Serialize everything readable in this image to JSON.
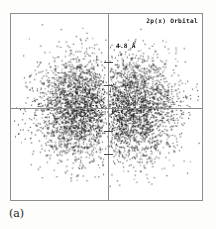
{
  "figure": {
    "caption": "(a)",
    "orbital_label": "2p(x) Orbital",
    "scale_label": "4.8 Å",
    "frame_color": "#8e8e8e",
    "axis_color": "#8a8a8a",
    "dot_color": "#111111",
    "background_color": "#ffffff"
  },
  "chart_data": {
    "type": "scatter",
    "title": "2p(x) Orbital",
    "subtitle": "(a)",
    "xlabel": "",
    "ylabel": "",
    "annotations": [
      {
        "text": "2p(x) Orbital",
        "position": "top-right"
      },
      {
        "text": "4.8 Å",
        "position": "near-upper-vertical-axis-tick"
      },
      {
        "text": "(a)",
        "position": "below-frame-left"
      }
    ],
    "grid": false,
    "legend_position": "none",
    "axis_lines": {
      "vertical_at_x": 0,
      "horizontal_at_y": 0
    },
    "vertical_axis_ticks": [
      -4.8,
      -2.4,
      2.4,
      4.8
    ],
    "tick_label_shown": "4.8 Å",
    "xlim": [
      -9.6,
      9.6
    ],
    "ylim": [
      -9.4,
      9.4
    ],
    "n_points": 5200,
    "lobes": [
      {
        "name": "left-lobe",
        "center_x": -2.6,
        "center_y": 0.0,
        "sigma_x": 2.3,
        "sigma_y": 2.6,
        "fraction": 0.5
      },
      {
        "name": "right-lobe",
        "center_x": 2.6,
        "center_y": 0.0,
        "sigma_x": 2.3,
        "sigma_y": 2.6,
        "fraction": 0.5
      }
    ],
    "nodal_plane_x": 0.0,
    "symmetry": "mirror about both vertical and horizontal axes"
  }
}
